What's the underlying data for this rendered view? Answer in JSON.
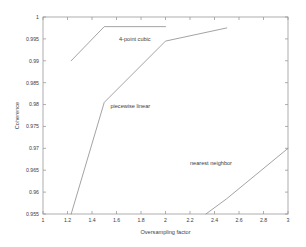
{
  "chart_data": {
    "type": "line",
    "title": "",
    "xlabel": "Oversampling factor",
    "ylabel": "Coherence",
    "xlim": [
      1,
      3
    ],
    "ylim": [
      0.955,
      1
    ],
    "xticks": [
      1,
      1.2,
      1.4,
      1.6,
      1.8,
      2,
      2.2,
      2.4,
      2.6,
      2.8,
      3
    ],
    "xticklabels": [
      "1",
      "1.2",
      "1.4",
      "1.6",
      "1.8",
      "2",
      "2.2",
      "2.4",
      "2.6",
      "2.8",
      "3"
    ],
    "yticks": [
      0.955,
      0.96,
      0.965,
      0.97,
      0.975,
      0.98,
      0.985,
      0.99,
      0.995,
      1
    ],
    "yticklabels": [
      "0.955",
      "0.96",
      "0.965",
      "0.97",
      "0.975",
      "0.98",
      "0.985",
      "0.99",
      "0.995",
      "1"
    ],
    "grid": false,
    "legend_position": "inline-annotations",
    "line_color": "#8c8c8c",
    "series": [
      {
        "name": "4-point cubic",
        "x": [
          1.23,
          1.5,
          2.0
        ],
        "y": [
          0.99,
          0.9978,
          0.9978
        ],
        "annotation": {
          "text": "4-point cubic",
          "x": 1.62,
          "y": 0.9945
        }
      },
      {
        "name": "piecewise linear",
        "x": [
          1.23,
          1.5,
          2.0,
          2.5
        ],
        "y": [
          0.955,
          0.9805,
          0.9945,
          0.9975
        ],
        "annotation": {
          "text": "piecewise linear",
          "x": 1.55,
          "y": 0.9793
        }
      },
      {
        "name": "nearest neighbor",
        "x": [
          2.33,
          2.5,
          3.0
        ],
        "y": [
          0.955,
          0.9585,
          0.97
        ],
        "annotation": {
          "text": "nearest neighbor",
          "x": 2.2,
          "y": 0.9662
        }
      }
    ]
  },
  "plot_box": {
    "left": 43,
    "top": 17,
    "right": 288,
    "bottom": 214
  }
}
